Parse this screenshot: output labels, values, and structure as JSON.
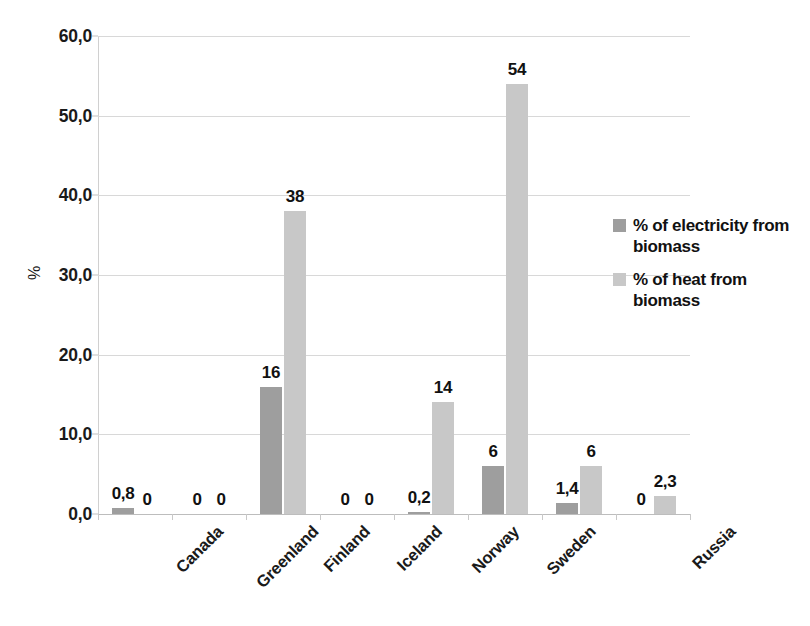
{
  "chart_data": {
    "type": "bar",
    "title": "",
    "subtitle": "",
    "xlabel": "",
    "ylabel": "%",
    "ylim": [
      0,
      60
    ],
    "ytick_labels": [
      "0,0",
      "10,0",
      "20,0",
      "30,0",
      "40,0",
      "50,0",
      "60,0"
    ],
    "ytick_values": [
      0,
      10,
      20,
      30,
      40,
      50,
      60
    ],
    "grid": true,
    "legend_position": "right",
    "categories": [
      "Canada",
      "Greenland",
      "Finland",
      "Iceland",
      "Norway",
      "Sweden",
      "",
      "Russia"
    ],
    "series": [
      {
        "name": "% of electricity from biomass",
        "color": "#9e9e9e",
        "values": [
          0.8,
          0,
          16,
          0,
          0.2,
          6,
          1.4,
          0
        ],
        "labels": [
          "0,8",
          "0",
          "16",
          "0",
          "0,2",
          "6",
          "1,4",
          "0"
        ]
      },
      {
        "name": "% of heat from biomass",
        "color": "#c8c8c8",
        "values": [
          0,
          0,
          38,
          0,
          14,
          54,
          6,
          2.3
        ],
        "labels": [
          "0",
          "0",
          "38",
          "0",
          "14",
          "54",
          "6",
          "2,3"
        ]
      }
    ]
  },
  "legend": {
    "items": [
      {
        "label": "% of electricity from biomass",
        "color": "#9e9e9e"
      },
      {
        "label": "% of heat from biomass",
        "color": "#c8c8c8"
      }
    ]
  },
  "colors": {
    "background": "#ffffff",
    "gridline": "#d8d8d8",
    "axis": "#c8c8c8",
    "text": "#1a1a1a",
    "series_electricity": "#9e9e9e",
    "series_heat": "#c8c8c8"
  }
}
